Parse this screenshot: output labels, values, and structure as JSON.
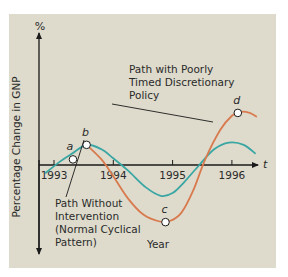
{
  "chart_data": {
    "type": "line",
    "title": "",
    "xlabel": "Year",
    "ylabel": "Percentage Change in GNP",
    "y_unit_label": "%",
    "x_axis_symbol": "t",
    "x_ticks": [
      "1993",
      "1994",
      "1995",
      "1996"
    ],
    "xlim": [
      1992.85,
      1996.45
    ],
    "ylim": [
      -1.2,
      1.2
    ],
    "grid": false,
    "legend": "none",
    "series": [
      {
        "name": "Path Without Intervention (Normal Cyclical Pattern)",
        "color": "#3aa6a4",
        "x": [
          1992.85,
          1993.1,
          1993.3,
          1993.55,
          1993.8,
          1994.0,
          1994.25,
          1994.55,
          1994.8,
          1995.0,
          1995.2,
          1995.45,
          1995.7,
          1995.95,
          1996.2,
          1996.4
        ],
        "y": [
          -0.15,
          0.06,
          0.2,
          0.36,
          0.28,
          0.12,
          -0.1,
          -0.4,
          -0.55,
          -0.5,
          -0.3,
          0.0,
          0.28,
          0.4,
          0.36,
          0.2
        ]
      },
      {
        "name": "Path with Poorly Timed Discretionary Policy",
        "color": "#d97a4e",
        "x": [
          1993.55,
          1993.8,
          1994.0,
          1994.25,
          1994.5,
          1994.75,
          1994.95,
          1995.15,
          1995.35,
          1995.55,
          1995.8,
          1996.0,
          1996.15,
          1996.3,
          1996.42
        ],
        "y": [
          0.36,
          0.1,
          -0.2,
          -0.6,
          -0.88,
          -1.0,
          -1.0,
          -0.85,
          -0.45,
          0.1,
          0.62,
          0.88,
          0.95,
          0.93,
          0.86
        ]
      }
    ],
    "points": [
      {
        "label": "a",
        "x": 1993.32,
        "y": 0.1
      },
      {
        "label": "b",
        "x": 1993.55,
        "y": 0.36
      },
      {
        "label": "c",
        "x": 1994.88,
        "y": -1.02
      },
      {
        "label": "d",
        "x": 1996.1,
        "y": 0.93
      }
    ],
    "annotations": [
      {
        "text_lines": [
          "Path with Poorly",
          "Timed Discretionary",
          "Policy"
        ],
        "target_series": "Path with Poorly Timed Discretionary Policy"
      },
      {
        "text_lines": [
          "Path Without",
          "Intervention",
          "(Normal Cyclical",
          "Pattern)"
        ],
        "target_series": "Path Without Intervention (Normal Cyclical Pattern)"
      }
    ]
  }
}
